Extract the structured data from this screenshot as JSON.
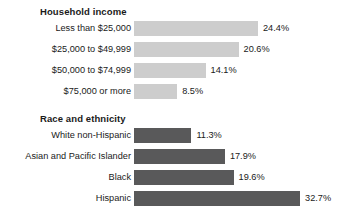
{
  "chart_data": {
    "type": "bar",
    "title": "",
    "xlabel": "",
    "ylabel": "",
    "orientation": "horizontal",
    "grid": false,
    "legend": "none",
    "value_suffix": "%",
    "xlim": [
      0,
      32.7
    ],
    "px_per_unit": 5.08,
    "colors": {
      "household_income_bar": "#cdcdcd",
      "race_ethnicity_bar": "#59595a",
      "text": "#1a1a1a",
      "background": "#ffffff"
    },
    "groups": [
      {
        "title": "Household income",
        "bar_color": "#cdcdcd",
        "categories": [
          "Less than $25,000",
          "$25,000 to $49,999",
          "$50,000 to $74,999",
          "$75,000 or more"
        ],
        "values": [
          24.4,
          20.6,
          14.1,
          8.5
        ],
        "labels": [
          "24.4%",
          "20.6%",
          "14.1%",
          "8.5%"
        ]
      },
      {
        "title": "Race and ethnicity",
        "bar_color": "#59595a",
        "categories": [
          "White non-Hispanic",
          "Asian and Pacific Islander",
          "Black",
          "Hispanic"
        ],
        "values": [
          11.3,
          17.9,
          19.6,
          32.7
        ],
        "labels": [
          "11.3%",
          "17.9%",
          "19.6%",
          "32.7%"
        ]
      }
    ]
  }
}
